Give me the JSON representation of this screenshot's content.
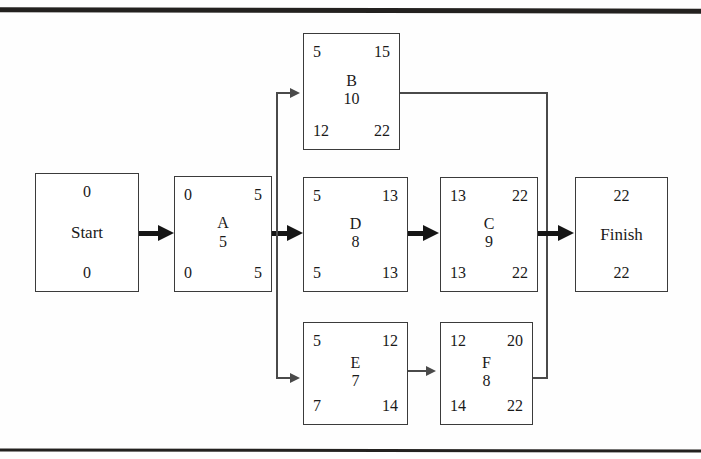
{
  "diagram": {
    "nodes": [
      {
        "id": "start",
        "name": "Start",
        "duration": "",
        "es": "0",
        "ef": "",
        "ls": "0",
        "lf": "",
        "terminal": true,
        "x": 35,
        "y": 173,
        "w": 104,
        "h": 119
      },
      {
        "id": "a",
        "name": "A",
        "duration": "5",
        "es": "0",
        "ef": "5",
        "ls": "0",
        "lf": "5",
        "terminal": false,
        "x": 174,
        "y": 176,
        "w": 98,
        "h": 116
      },
      {
        "id": "b",
        "name": "B",
        "duration": "10",
        "es": "5",
        "ef": "15",
        "ls": "12",
        "lf": "22",
        "terminal": false,
        "x": 303,
        "y": 33,
        "w": 97,
        "h": 117
      },
      {
        "id": "d",
        "name": "D",
        "duration": "8",
        "es": "5",
        "ef": "13",
        "ls": "5",
        "lf": "13",
        "terminal": false,
        "x": 303,
        "y": 177,
        "w": 105,
        "h": 115
      },
      {
        "id": "c",
        "name": "C",
        "duration": "9",
        "es": "13",
        "ef": "22",
        "ls": "13",
        "lf": "22",
        "terminal": false,
        "x": 440,
        "y": 177,
        "w": 98,
        "h": 115
      },
      {
        "id": "e",
        "name": "E",
        "duration": "7",
        "es": "5",
        "ef": "12",
        "ls": "7",
        "lf": "14",
        "terminal": false,
        "x": 303,
        "y": 322,
        "w": 105,
        "h": 103
      },
      {
        "id": "f",
        "name": "F",
        "duration": "8",
        "es": "12",
        "ef": "20",
        "ls": "14",
        "lf": "22",
        "terminal": false,
        "x": 440,
        "y": 322,
        "w": 93,
        "h": 103
      },
      {
        "id": "finish",
        "name": "Finish",
        "duration": "",
        "es": "22",
        "ef": "",
        "ls": "22",
        "lf": "",
        "terminal": true,
        "x": 575,
        "y": 177,
        "w": 93,
        "h": 115
      }
    ],
    "edges": [
      {
        "id": "start-to-a",
        "from": "Start",
        "to": "A",
        "critical": true
      },
      {
        "id": "a-to-d",
        "from": "A",
        "to": "D",
        "critical": true
      },
      {
        "id": "a-to-b",
        "from": "A",
        "to": "B",
        "critical": false
      },
      {
        "id": "a-to-e",
        "from": "A",
        "to": "E",
        "critical": false
      },
      {
        "id": "d-to-c",
        "from": "D",
        "to": "C",
        "critical": true
      },
      {
        "id": "e-to-f",
        "from": "E",
        "to": "F",
        "critical": false
      },
      {
        "id": "b-to-finish",
        "from": "B",
        "to": "Finish",
        "critical": false
      },
      {
        "id": "f-to-finish",
        "from": "F",
        "to": "Finish",
        "critical": false
      },
      {
        "id": "c-to-finish",
        "from": "C",
        "to": "Finish",
        "critical": true
      }
    ],
    "legend": {
      "top_left": "Earliest Start",
      "top_right": "Earliest Finish",
      "bottom_left": "Latest Start",
      "bottom_right": "Latest Finish",
      "center": "Activity / Duration"
    },
    "project_duration": "22"
  }
}
